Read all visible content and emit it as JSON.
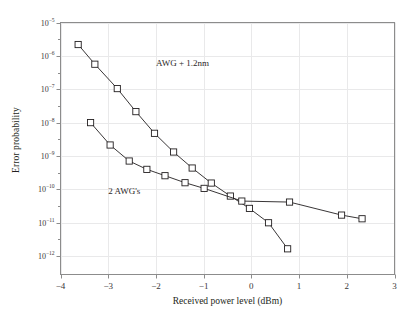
{
  "figure": {
    "background": "#ffffff",
    "frame_color": "#8c8c8c",
    "grid_color": "#e9e9ea",
    "line_color": "#231f20",
    "marker_color": "#ffffff"
  },
  "chart_data": {
    "type": "line",
    "title": "",
    "xlabel": "Received power level (dBm)",
    "ylabel": "Error probability",
    "xlim": [
      -4,
      3
    ],
    "ylim_log10": [
      -12.55,
      -5
    ],
    "yscale": "log",
    "grid": true,
    "legend_position": "inline-annotations",
    "xticks": [
      -4,
      -3,
      -2,
      -1,
      0,
      1,
      2,
      3
    ],
    "xtick_labels": [
      "−4",
      "−3",
      "−2",
      "−1",
      "0",
      "1",
      "2",
      "3"
    ],
    "yticks_exponent": [
      -5,
      -6,
      -7,
      -8,
      -9,
      -10,
      -11,
      -12
    ],
    "ytick_labels": [
      "10-5",
      "10-6",
      "10-7",
      "10-8",
      "10-9",
      "10-10",
      "10-11",
      "10-12"
    ],
    "series": [
      {
        "name": "AWG + 1.2 nm",
        "annotation": "AWG + 1.2nm",
        "marker": "square-open",
        "x": [
          -3.63,
          -3.28,
          -2.81,
          -2.42,
          -2.03,
          -1.63,
          -1.24,
          -0.84,
          -0.44,
          -0.04,
          0.36,
          0.76
        ],
        "y_exponent": [
          -5.66,
          -6.25,
          -6.98,
          -7.67,
          -8.32,
          -8.88,
          -9.36,
          -9.81,
          -10.2,
          -10.57,
          -11.0,
          -11.78
        ]
      },
      {
        "name": "2 AWG's",
        "annotation": "2 AWG's",
        "marker": "square-open",
        "x": [
          -3.37,
          -2.96,
          -2.56,
          -2.19,
          -1.81,
          -1.39,
          -0.99,
          -0.2,
          0.8,
          1.89,
          2.32
        ],
        "y_exponent": [
          -8.0,
          -8.67,
          -9.15,
          -9.4,
          -9.59,
          -9.8,
          -9.97,
          -10.35,
          -10.38,
          -10.77,
          -10.88
        ]
      }
    ],
    "annotations": [
      {
        "text": "AWG + 1.2nm",
        "x": -2.0,
        "y_exponent": -6.28
      },
      {
        "text": "2 AWG's",
        "x": -3.0,
        "y_exponent": -10.1
      }
    ]
  }
}
